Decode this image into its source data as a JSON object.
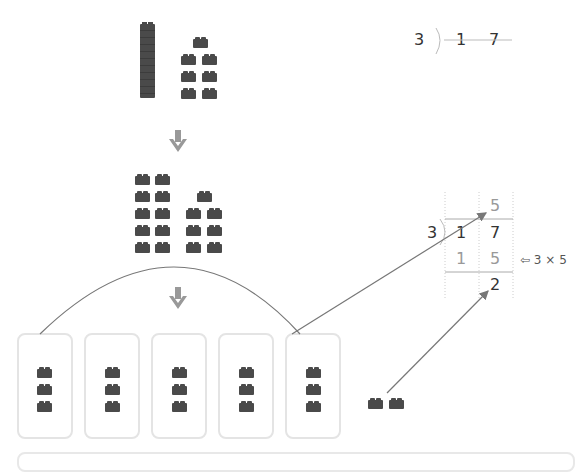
{
  "top_division": {
    "divisor": "3",
    "dividend_tens": "1",
    "dividend_ones": "7"
  },
  "worked_division": {
    "divisor": "3",
    "quotient": "5",
    "dividend_tens": "1",
    "dividend_ones": "7",
    "product_tens": "1",
    "product_ones": "5",
    "remainder": "2",
    "note": "⇦ 3 × 5"
  },
  "blocks": {
    "initial_tens_stacks": 1,
    "initial_ones": 7,
    "regrouped_ones": 17,
    "groups": 5,
    "per_group": 3,
    "leftover": 2
  },
  "colors": {
    "brick": "#4a4a4a",
    "arrow": "#999999",
    "line": "#777777",
    "box_border": "#e4e4e4"
  }
}
